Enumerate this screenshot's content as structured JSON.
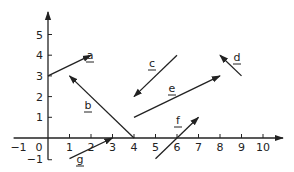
{
  "diagram": {
    "type": "coordinate-plane-vectors",
    "x_axis": {
      "ticks": [
        "-1",
        "0",
        "1",
        "2",
        "3",
        "4",
        "5",
        "6",
        "7",
        "8",
        "9",
        "10"
      ],
      "range": [
        -1,
        10
      ]
    },
    "y_axis": {
      "ticks": [
        "-1",
        "1",
        "2",
        "3",
        "4",
        "5"
      ],
      "range": [
        -1,
        5
      ]
    },
    "vectors": [
      {
        "label": "a",
        "from": [
          0,
          3
        ],
        "to": [
          2,
          4
        ]
      },
      {
        "label": "b",
        "from": [
          4,
          0
        ],
        "to": [
          1,
          3
        ]
      },
      {
        "label": "c",
        "from": [
          6,
          4
        ],
        "to": [
          4,
          2
        ]
      },
      {
        "label": "d",
        "from": [
          9,
          3
        ],
        "to": [
          8,
          4
        ]
      },
      {
        "label": "e",
        "from": [
          4,
          1
        ],
        "to": [
          8,
          3
        ]
      },
      {
        "label": "f",
        "from": [
          5,
          -1
        ],
        "to": [
          7,
          1
        ]
      },
      {
        "label": "g",
        "from": [
          1,
          -1
        ],
        "to": [
          3,
          0
        ]
      }
    ],
    "colors": {
      "ink": "#222222",
      "background": "#ffffff"
    }
  }
}
